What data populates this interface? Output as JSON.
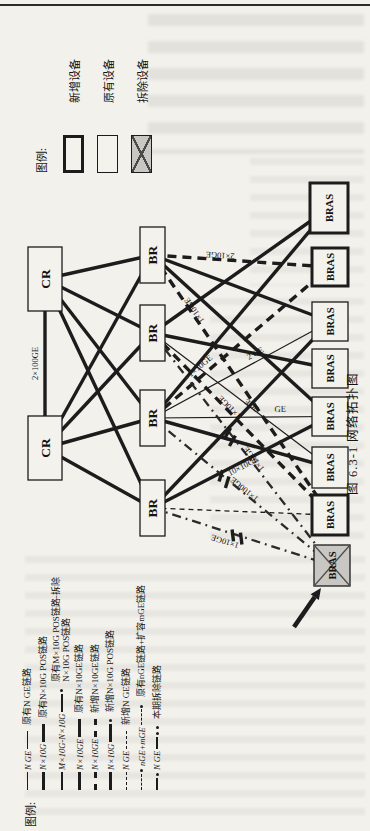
{
  "colors": {
    "ink": "#1c1c1c",
    "paper": "#f3f1ec",
    "removed_fill": "#c9c7c3"
  },
  "figure": {
    "caption": "图 6.3-1  网络拓扑图"
  },
  "device_legend": {
    "title": "图例:",
    "items": [
      {
        "label": "新增设备",
        "box": "bold"
      },
      {
        "label": "原有设备",
        "box": "thin"
      },
      {
        "label": "拆除设备",
        "box": "removed"
      }
    ]
  },
  "link_legend": {
    "title": "图例:",
    "rows": [
      {
        "style": "solid-thin",
        "inline": "N GE",
        "desc": "原有N GE链路"
      },
      {
        "style": "solid-thick",
        "inline": "N×10G",
        "desc": "原有N×10G POS链路"
      },
      {
        "style": "solid-med-dot",
        "inline": "M×10G-N×10G",
        "desc": "原有M×10G POS链路-拆除",
        "desc2": "N×10G POS链路"
      },
      {
        "style": "solid-thick",
        "inline": "N×10GE",
        "desc": "原有N×10GE链路"
      },
      {
        "style": "dash-thick",
        "inline": "N×10GE",
        "desc": "新增N×10GE链路"
      },
      {
        "style": "solid-thick-dot",
        "inline": "N×10G",
        "desc": "新增N×10G POS链路"
      },
      {
        "style": "dash-thin",
        "inline": "N GE",
        "desc": "新增N GE链路"
      },
      {
        "style": "dash-dot-thin",
        "inline": "nGE+mGE",
        "desc": "原有nGE链路+扩容mGE链路"
      },
      {
        "style": "removed",
        "inline": "N GE",
        "desc": "本期拆除链路"
      }
    ]
  },
  "topology": {
    "nodes": [
      {
        "id": "CR_L",
        "label": "CR",
        "kind": "cr",
        "x": 351,
        "y": 28,
        "w": 64,
        "h": 34
      },
      {
        "id": "CR_R",
        "label": "CR",
        "kind": "cr",
        "x": 520,
        "y": 28,
        "w": 64,
        "h": 34
      },
      {
        "id": "BR1",
        "label": "BR",
        "kind": "br",
        "x": 548,
        "y": 140,
        "w": 56,
        "h": 25
      },
      {
        "id": "BR2",
        "label": "BR",
        "kind": "br",
        "x": 470,
        "y": 140,
        "w": 56,
        "h": 25
      },
      {
        "id": "BR3",
        "label": "BR",
        "kind": "br",
        "x": 385,
        "y": 140,
        "w": 56,
        "h": 25
      },
      {
        "id": "BR4",
        "label": "BR",
        "kind": "br",
        "x": 295,
        "y": 140,
        "w": 56,
        "h": 25
      },
      {
        "id": "BRAS1",
        "label": "BRAS",
        "kind": "bras-bold",
        "x": 598,
        "y": 310,
        "w": 50,
        "h": 38
      },
      {
        "id": "BRAS2",
        "label": "BRAS",
        "kind": "bras-bold",
        "x": 545,
        "y": 312,
        "w": 38,
        "h": 36
      },
      {
        "id": "BRAS3",
        "label": "BRAS",
        "kind": "bras",
        "x": 490,
        "y": 312,
        "w": 39,
        "h": 36
      },
      {
        "id": "BRAS4",
        "label": "BRAS",
        "kind": "bras",
        "x": 443,
        "y": 312,
        "w": 39,
        "h": 36
      },
      {
        "id": "BRAS5",
        "label": "BRAS",
        "kind": "bras",
        "x": 395,
        "y": 312,
        "w": 39,
        "h": 36
      },
      {
        "id": "BRAS6",
        "label": "BRAS",
        "kind": "bras",
        "x": 343,
        "y": 312,
        "w": 41,
        "h": 36
      },
      {
        "id": "BRAS7",
        "label": "BRAS",
        "kind": "bras-bold",
        "x": 296,
        "y": 312,
        "w": 40,
        "h": 36
      },
      {
        "id": "BRAS8",
        "label": "BRAS",
        "kind": "bras-removed",
        "x": 245,
        "y": 314,
        "w": 41,
        "h": 36
      }
    ],
    "links": [
      {
        "from": "CR_L",
        "to": "CR_R",
        "style": "solid-thick",
        "label": "2×100GE",
        "t": 0.5,
        "off": -7
      },
      {
        "from": "CR_L",
        "to": "BR1",
        "style": "solid-thick"
      },
      {
        "from": "CR_L",
        "to": "BR2",
        "style": "solid-thick"
      },
      {
        "from": "CR_L",
        "to": "BR3",
        "style": "solid-thick"
      },
      {
        "from": "CR_L",
        "to": "BR4",
        "style": "solid-thick"
      },
      {
        "from": "CR_R",
        "to": "BR1",
        "style": "solid-thick"
      },
      {
        "from": "CR_R",
        "to": "BR2",
        "style": "solid-thick"
      },
      {
        "from": "CR_R",
        "to": "BR3",
        "style": "solid-thick"
      },
      {
        "from": "CR_R",
        "to": "BR4",
        "style": "solid-thick"
      },
      {
        "from": "BR1",
        "to": "BRAS3",
        "style": "solid-thick"
      },
      {
        "from": "BR1",
        "to": "BRAS5",
        "style": "solid-thick"
      },
      {
        "from": "BR2",
        "to": "BRAS1",
        "style": "solid-thick"
      },
      {
        "from": "BR2",
        "to": "BRAS4",
        "style": "solid-thick"
      },
      {
        "from": "BR3",
        "to": "BRAS1",
        "style": "solid-thick"
      },
      {
        "from": "BR3",
        "to": "BRAS6",
        "style": "solid-thick"
      },
      {
        "from": "BR4",
        "to": "BRAS5",
        "style": "solid-thick",
        "label": "10×10GE",
        "t": 0.5,
        "off": 7
      },
      {
        "from": "BR4",
        "to": "BRAS3",
        "style": "solid-thick"
      },
      {
        "from": "BR2",
        "to": "BRAS6",
        "style": "solid-thin",
        "label": "3GE",
        "t": 0.55,
        "off": -5
      },
      {
        "from": "BR3",
        "to": "BRAS3",
        "style": "solid-thin",
        "label": "2 GE",
        "t": 0.6,
        "off": -5
      },
      {
        "from": "BR3",
        "to": "BRAS5",
        "style": "solid-thin",
        "label": "GE",
        "t": 0.72,
        "off": -5
      },
      {
        "from": "BR1",
        "to": "BRAS2",
        "style": "dash-thick",
        "label": "2×10GE",
        "t": 0.38,
        "off": -7
      },
      {
        "from": "BR1",
        "to": "BRAS7",
        "style": "dash-thick",
        "label": "1×10GE",
        "t": 0.22,
        "off": -6
      },
      {
        "from": "BR2",
        "to": "BRAS7",
        "style": "dash-thick",
        "label": "1×10GE",
        "t": 0.42,
        "off": -6
      },
      {
        "from": "BR3",
        "to": "BRAS2",
        "style": "dash-thick",
        "label": "1×10GE",
        "t": 0.3,
        "off": -6
      },
      {
        "from": "BR4",
        "to": "BRAS7",
        "style": "dash-thin"
      },
      {
        "from": "BR2",
        "to": "BRAS8",
        "style": "removed",
        "label": "1×10GE",
        "t": 0.55,
        "off": -6
      },
      {
        "from": "BR3",
        "to": "BRAS8",
        "style": "removed",
        "label": "1×100GE",
        "t": 0.5,
        "off": -6
      },
      {
        "from": "BR4",
        "to": "BRAS8",
        "style": "removed",
        "label": "1×10GE",
        "t": 0.42,
        "off": 7
      }
    ],
    "cut_marks": [
      {
        "x": 394,
        "y": 230,
        "angle": 148
      },
      {
        "x": 352,
        "y": 224,
        "angle": 135
      },
      {
        "x": 294,
        "y": 237,
        "angle": 111
      }
    ],
    "arrow": {
      "x1": 204,
      "y1": 294,
      "x2": 243,
      "y2": 321
    }
  }
}
